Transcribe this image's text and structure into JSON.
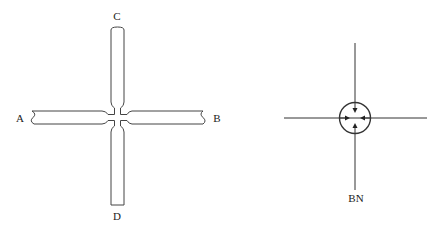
{
  "left_diagram": {
    "labels": {
      "a": "A",
      "b": "B",
      "c": "C",
      "d": "D"
    },
    "description": "cross-shaped microchannel junction with constricted center"
  },
  "right_diagram": {
    "label": "BN",
    "description": "circle at crossing of two lines with four inward-pointing arrows"
  },
  "colors": {
    "stroke": "#333333",
    "background": "#ffffff"
  }
}
